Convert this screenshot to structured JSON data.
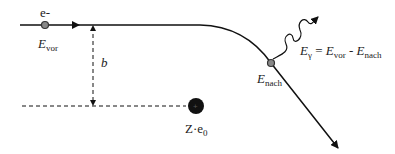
{
  "labels": {
    "electron": "e-",
    "e_vor_main": "E",
    "e_vor_sub": "vor",
    "b": "b",
    "e_nach_main": "E",
    "e_nach_sub": "nach",
    "egamma_main": "E",
    "egamma_sub": "γ",
    "egamma_eq": " = ",
    "egamma_e1": "E",
    "egamma_e1_sub": "vor",
    "egamma_minus": " - ",
    "egamma_e2": "E",
    "egamma_e2_sub": "nach",
    "nucleus_z": "Z·e",
    "nucleus_sub": "0"
  }
}
